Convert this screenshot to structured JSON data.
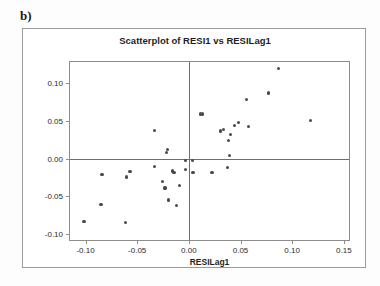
{
  "panel": {
    "label": "b)"
  },
  "chart_data": {
    "type": "scatter",
    "title": "Scatterplot of RESI1 vs RESILag1",
    "xlabel": "RESILag1",
    "ylabel": "RESI1",
    "xlim": [
      -0.115,
      0.155
    ],
    "ylim": [
      -0.108,
      0.128
    ],
    "xticks": [
      -0.1,
      -0.05,
      0.0,
      0.05,
      0.1,
      0.15
    ],
    "xticklabels": [
      "-0.10",
      "-0.05",
      "0.00",
      "0.05",
      "0.10",
      "0.15"
    ],
    "yticks": [
      -0.1,
      -0.05,
      0.0,
      0.05,
      0.1
    ],
    "yticklabels": [
      "-0.10",
      "-0.05",
      "0.00",
      "0.05",
      "0.10"
    ],
    "grid": false,
    "legend": false,
    "reference_lines": {
      "vertical_x": 0.0,
      "horizontal_y": 0.0
    },
    "marker_color": "#4a4a4a",
    "points": [
      {
        "x": -0.1015,
        "y": -0.083
      },
      {
        "x": -0.085,
        "y": -0.0605
      },
      {
        "x": -0.084,
        "y": -0.0215
      },
      {
        "x": -0.0615,
        "y": -0.085
      },
      {
        "x": -0.0605,
        "y": -0.0245
      },
      {
        "x": -0.057,
        "y": -0.017
      },
      {
        "x": -0.0335,
        "y": 0.0375
      },
      {
        "x": -0.033,
        "y": -0.011
      },
      {
        "x": -0.0255,
        "y": -0.03
      },
      {
        "x": -0.023,
        "y": -0.039
      },
      {
        "x": -0.0215,
        "y": 0.008
      },
      {
        "x": -0.0205,
        "y": 0.0125
      },
      {
        "x": -0.02,
        "y": -0.055
      },
      {
        "x": -0.0155,
        "y": -0.0165
      },
      {
        "x": -0.015,
        "y": -0.018
      },
      {
        "x": -0.014,
        "y": -0.019
      },
      {
        "x": -0.012,
        "y": -0.062
      },
      {
        "x": -0.009,
        "y": -0.0355
      },
      {
        "x": -0.0035,
        "y": -0.0025
      },
      {
        "x": -0.003,
        "y": -0.015
      },
      {
        "x": 0.0035,
        "y": -0.003
      },
      {
        "x": 0.004,
        "y": -0.019
      },
      {
        "x": 0.011,
        "y": 0.059
      },
      {
        "x": 0.0135,
        "y": 0.059
      },
      {
        "x": 0.0225,
        "y": -0.019
      },
      {
        "x": 0.031,
        "y": 0.0365
      },
      {
        "x": 0.0335,
        "y": 0.039
      },
      {
        "x": 0.0375,
        "y": -0.012
      },
      {
        "x": 0.0385,
        "y": 0.0235
      },
      {
        "x": 0.039,
        "y": 0.0045
      },
      {
        "x": 0.04,
        "y": 0.032
      },
      {
        "x": 0.044,
        "y": 0.044
      },
      {
        "x": 0.048,
        "y": 0.0475
      },
      {
        "x": 0.056,
        "y": 0.0785
      },
      {
        "x": 0.0575,
        "y": 0.0425
      },
      {
        "x": 0.077,
        "y": 0.087
      },
      {
        "x": 0.0865,
        "y": 0.119
      },
      {
        "x": 0.1175,
        "y": 0.05
      }
    ]
  }
}
